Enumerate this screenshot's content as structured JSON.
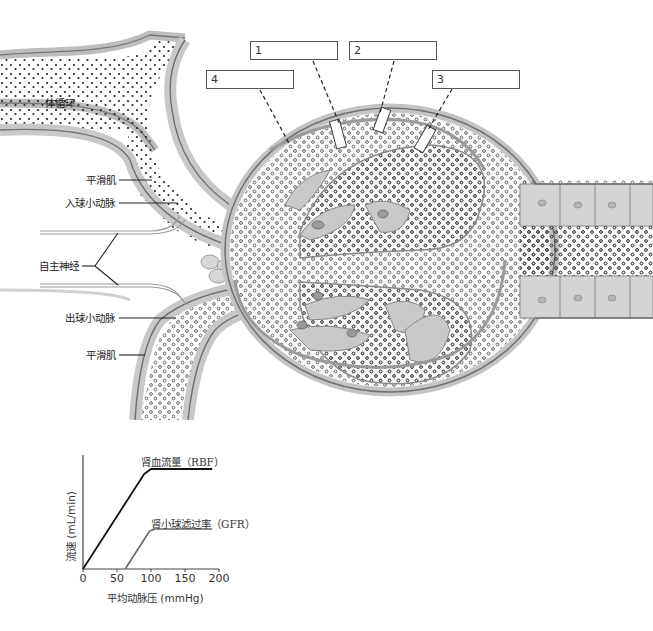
{
  "diagram": {
    "title": "",
    "left_labels": [
      {
        "id": "systemic",
        "text": "体循环"
      },
      {
        "id": "smooth-muscle-top",
        "text": "平滑肌"
      },
      {
        "id": "afferent-arteriole",
        "text": "入球小动脉"
      },
      {
        "id": "autonomic-nerve",
        "text": "自主神经"
      },
      {
        "id": "efferent-arteriole",
        "text": "出球小动脉"
      },
      {
        "id": "smooth-muscle-bottom",
        "text": "平滑肌"
      }
    ],
    "blank_boxes": [
      {
        "number": "1",
        "text": ""
      },
      {
        "number": "2",
        "text": ""
      },
      {
        "number": "3",
        "text": ""
      },
      {
        "number": "4",
        "text": ""
      }
    ],
    "colors": {
      "tissue_light": "#d9d9d9",
      "tissue_mid": "#bdbdbd",
      "tissue_dark": "#8a8a8a",
      "line": "#555555",
      "rbf_line": "#111111",
      "gfr_line": "#666666"
    }
  },
  "chart_data": {
    "type": "line",
    "title": "",
    "xlabel": "平均动脉压 (mmHg)",
    "ylabel": "流速 (mL/min)",
    "xlim": [
      0,
      200
    ],
    "x_ticks": [
      "0",
      "50",
      "100",
      "150",
      "200"
    ],
    "y_ticks": [],
    "grid": false,
    "legend_position": "inline-annotations",
    "series": [
      {
        "name": "肾血流量（RBF）",
        "x": [
          0,
          90,
          100,
          190
        ],
        "y": [
          0,
          95,
          100,
          100
        ]
      },
      {
        "name": "肾小球滤过率（GFR）",
        "x": [
          62,
          98,
          106,
          190
        ],
        "y": [
          0,
          38,
          40,
          40
        ]
      }
    ]
  }
}
